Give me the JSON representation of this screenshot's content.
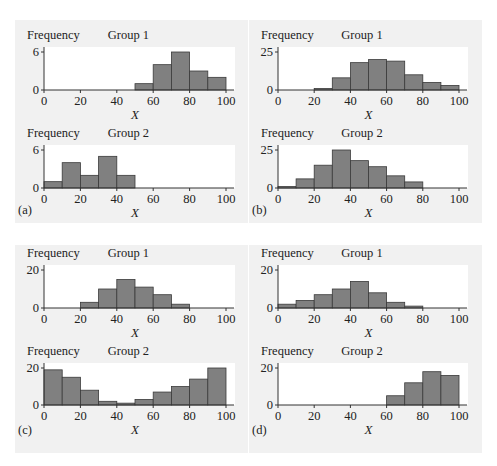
{
  "chart_data": [
    {
      "panel": "(a)",
      "type": "bar",
      "subplots": [
        {
          "title": "Group 1",
          "ylabel": "Frequency",
          "xlabel": "X",
          "ytick": 6,
          "ylim": [
            0,
            7
          ],
          "xticks": [
            0,
            20,
            40,
            60,
            80,
            100
          ],
          "xlim": [
            0,
            100
          ],
          "bin_width": 10,
          "bins": [
            50,
            60,
            70,
            80,
            90
          ],
          "values": [
            1,
            4,
            6,
            3,
            2
          ]
        },
        {
          "title": "Group 2",
          "ylabel": "Frequency",
          "xlabel": "X",
          "ytick": 6,
          "ylim": [
            0,
            7
          ],
          "xticks": [
            0,
            20,
            40,
            60,
            80,
            100
          ],
          "xlim": [
            0,
            100
          ],
          "bin_width": 10,
          "bins": [
            0,
            10,
            20,
            30,
            40
          ],
          "values": [
            1,
            4,
            2,
            5,
            2
          ]
        }
      ]
    },
    {
      "panel": "(b)",
      "type": "bar",
      "subplots": [
        {
          "title": "Group 1",
          "ylabel": "Frequency",
          "xlabel": "X",
          "ytick": 25,
          "ylim": [
            0,
            28
          ],
          "xticks": [
            0,
            20,
            40,
            60,
            80,
            100
          ],
          "xlim": [
            0,
            100
          ],
          "bin_width": 10,
          "bins": [
            20,
            30,
            40,
            50,
            60,
            70,
            80,
            90
          ],
          "values": [
            1,
            8,
            18,
            20,
            19,
            10,
            5,
            3
          ]
        },
        {
          "title": "Group 2",
          "ylabel": "Frequency",
          "xlabel": "X",
          "ytick": 25,
          "ylim": [
            0,
            28
          ],
          "xticks": [
            0,
            20,
            40,
            60,
            80,
            100
          ],
          "xlim": [
            0,
            100
          ],
          "bin_width": 10,
          "bins": [
            0,
            10,
            20,
            30,
            40,
            50,
            60,
            70
          ],
          "values": [
            1,
            6,
            15,
            25,
            18,
            14,
            8,
            4
          ]
        }
      ]
    },
    {
      "panel": "(c)",
      "type": "bar",
      "subplots": [
        {
          "title": "Group 1",
          "ylabel": "Frequency",
          "xlabel": "X",
          "ytick": 20,
          "ylim": [
            0,
            22
          ],
          "xticks": [
            0,
            20,
            40,
            60,
            80,
            100
          ],
          "xlim": [
            0,
            100
          ],
          "bin_width": 10,
          "bins": [
            20,
            30,
            40,
            50,
            60,
            70
          ],
          "values": [
            3,
            10,
            15,
            11,
            7,
            2
          ]
        },
        {
          "title": "Group 2",
          "ylabel": "Frequency",
          "xlabel": "X",
          "ytick": 20,
          "ylim": [
            0,
            22
          ],
          "xticks": [
            0,
            20,
            40,
            60,
            80,
            100
          ],
          "xlim": [
            0,
            100
          ],
          "bin_width": 10,
          "bins": [
            0,
            10,
            20,
            30,
            40,
            50,
            60,
            70,
            80,
            90
          ],
          "values": [
            19,
            15,
            8,
            2,
            1,
            3,
            7,
            10,
            14,
            20
          ]
        }
      ]
    },
    {
      "panel": "(d)",
      "type": "bar",
      "subplots": [
        {
          "title": "Group 1",
          "ylabel": "Frequency",
          "xlabel": "X",
          "ytick": 20,
          "ylim": [
            0,
            22
          ],
          "xticks": [
            0,
            20,
            40,
            60,
            80,
            100
          ],
          "xlim": [
            0,
            100
          ],
          "bin_width": 10,
          "bins": [
            0,
            10,
            20,
            30,
            40,
            50,
            60,
            70
          ],
          "values": [
            2,
            4,
            7,
            10,
            14,
            8,
            3,
            1
          ]
        },
        {
          "title": "Group 2",
          "ylabel": "Frequency",
          "xlabel": "X",
          "ytick": 20,
          "ylim": [
            0,
            22
          ],
          "xticks": [
            0,
            20,
            40,
            60,
            80,
            100
          ],
          "xlim": [
            0,
            100
          ],
          "bin_width": 10,
          "bins": [
            60,
            70,
            80,
            90
          ],
          "values": [
            5,
            12,
            18,
            16
          ]
        }
      ]
    }
  ],
  "colors": {
    "bar_fill": "#808080",
    "bar_edge": "#3a3a3a",
    "panel_bg": "#f1f1f1",
    "plot_bg": "#ffffff"
  }
}
